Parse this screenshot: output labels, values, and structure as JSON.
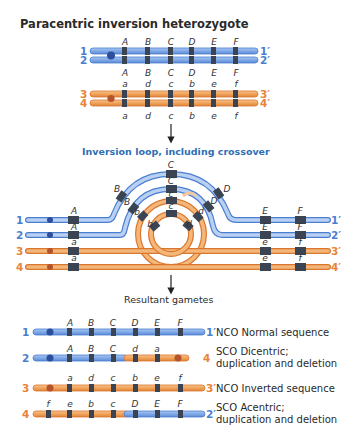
{
  "colors": {
    "blue_chromosome": "#7fa8e6",
    "blue_outline": "#4a7fd0",
    "orange_chromosome": "#f0a35a",
    "orange_outline": "#d9772e",
    "band": "#3a4453",
    "centromere_blue": "#2b4f9a",
    "centromere_orange": "#b5532a",
    "title_text": "#2a2a2a",
    "subtitle_blue": "#2f6fb5"
  },
  "panel1": {
    "title": "Paracentric inversion heterozygote",
    "top_genes": [
      "A",
      "B",
      "C",
      "D",
      "E",
      "F"
    ],
    "middle_upper_genes": [
      "A",
      "B",
      "C",
      "D",
      "E",
      "F"
    ],
    "middle_lower_genes": [
      "a",
      "d",
      "c",
      "b",
      "e",
      "f"
    ],
    "bottom_genes": [
      "a",
      "d",
      "c",
      "b",
      "e",
      "f"
    ],
    "chromatids": [
      {
        "left": "1",
        "right": "1′",
        "color": "blue"
      },
      {
        "left": "2",
        "right": "2′",
        "color": "blue"
      },
      {
        "left": "3",
        "right": "3′",
        "color": "orange"
      },
      {
        "left": "4",
        "right": "4′",
        "color": "orange"
      }
    ]
  },
  "panel2": {
    "title": "Inversion loop, including crossover",
    "loop_labels": {
      "outer_blue": [
        "B",
        "C",
        "D"
      ],
      "inner_blue": [
        "B",
        "C",
        "D"
      ],
      "outer_orange": [
        "b",
        "c",
        "d"
      ],
      "inner_orange": [
        "b",
        "c",
        "d"
      ]
    },
    "straight_labels": {
      "row1": [
        "A",
        "E",
        "F"
      ],
      "row2": [
        "A",
        "E",
        "F"
      ],
      "row3": [
        "a",
        "e",
        "f"
      ],
      "row4": [
        "a",
        "e",
        "f"
      ]
    },
    "chromatids": [
      {
        "left": "1",
        "right": "1′"
      },
      {
        "left": "2",
        "right": "2′"
      },
      {
        "left": "3",
        "right": "3′"
      },
      {
        "left": "4",
        "right": "4′"
      }
    ]
  },
  "panel3": {
    "title": "Resultant gametes",
    "gametes": [
      {
        "left": "1",
        "right": "1′",
        "genes": [
          "A",
          "B",
          "C",
          "D",
          "E",
          "F"
        ],
        "type": "NCO",
        "description": [
          "Normal sequence"
        ]
      },
      {
        "left": "2",
        "right": "4",
        "genes": [
          "A",
          "B",
          "C",
          "d",
          "a"
        ],
        "type": "SCO",
        "description": [
          "Dicentric;",
          "duplication and deletion"
        ]
      },
      {
        "left": "3",
        "right": "3′",
        "genes": [
          "a",
          "d",
          "c",
          "b",
          "e",
          "f"
        ],
        "type": "NCO",
        "description": [
          "Inverted sequence"
        ]
      },
      {
        "left": "4",
        "right": "2′",
        "genes": [
          "f",
          "e",
          "b",
          "c",
          "D",
          "E",
          "F"
        ],
        "type": "SCO",
        "description": [
          "Acentric;",
          "duplication and deletion"
        ]
      }
    ]
  }
}
